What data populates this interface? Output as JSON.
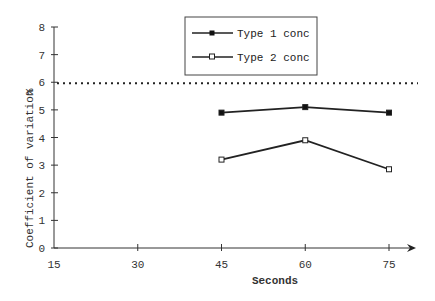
{
  "chart_data": {
    "type": "line",
    "title": "",
    "xlabel": "Seconds",
    "ylabel": "Coefficient of variation",
    "ylabel_unit": "%",
    "x": [
      45,
      60,
      75
    ],
    "x_ticks": [
      "15",
      "30",
      "45",
      "60",
      "75"
    ],
    "y_ticks": [
      "0",
      "1",
      "2",
      "3",
      "4",
      "5",
      "6",
      "7",
      "8"
    ],
    "xlim": [
      15,
      80
    ],
    "ylim": [
      0,
      8
    ],
    "grid": false,
    "legend_position": "top-center",
    "series": [
      {
        "name": "Type 1 conc",
        "marker": "filled-square",
        "values": [
          4.9,
          5.1,
          4.9
        ]
      },
      {
        "name": "Type 2 conc",
        "marker": "open-square",
        "values": [
          3.2,
          3.9,
          2.85
        ]
      }
    ],
    "reference_line": {
      "y": 6,
      "style": "dotted"
    }
  },
  "legend": {
    "items": [
      "Type 1 conc",
      "Type 2 conc"
    ]
  },
  "axes": {
    "x_title": "Seconds",
    "y_title": "Coefficient of variation",
    "y_unit": "%"
  }
}
